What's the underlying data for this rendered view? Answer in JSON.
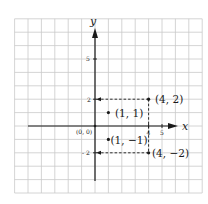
{
  "diagram": {
    "title": "",
    "grid": {
      "x_min": -6,
      "x_max": 8,
      "y_min": -5,
      "y_max": 8,
      "step": 1
    },
    "axes": {
      "x_label": "x",
      "y_label": "y"
    },
    "origin_label": "(0, 0)",
    "ticks": {
      "x": [
        {
          "value": 4,
          "label": "4"
        },
        {
          "value": 5,
          "label": "5"
        }
      ],
      "y": [
        {
          "value": 5,
          "label": "5"
        },
        {
          "value": 2,
          "label": "2"
        },
        {
          "value": -2,
          "label": "- 2"
        }
      ]
    },
    "points": [
      {
        "x": 4,
        "y": 2,
        "label": "(4, 2)"
      },
      {
        "x": 1,
        "y": 1,
        "label": "(1, 1)"
      },
      {
        "x": 1,
        "y": -1,
        "label": "(1, −1)"
      },
      {
        "x": 4,
        "y": -2,
        "label": "(4, −2)"
      }
    ],
    "colors": {
      "grid": "#c9c9c9",
      "ink": "#1a1a1a",
      "background": "#ffffff"
    }
  }
}
